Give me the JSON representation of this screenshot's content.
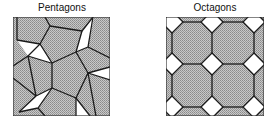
{
  "panels": [
    {
      "title": "Pentagons",
      "shape": "pentagon",
      "fill_pattern": "gray-dither",
      "gap_fill": "#ffffff"
    },
    {
      "title": "Octagons",
      "shape": "octagon",
      "fill_pattern": "gray-dither",
      "gap_fill": "#ffffff"
    }
  ],
  "colors": {
    "tile_fill": "#b4b4b4",
    "stroke": "#1a1a1a",
    "gap": "#ffffff",
    "background": "#ffffff"
  }
}
